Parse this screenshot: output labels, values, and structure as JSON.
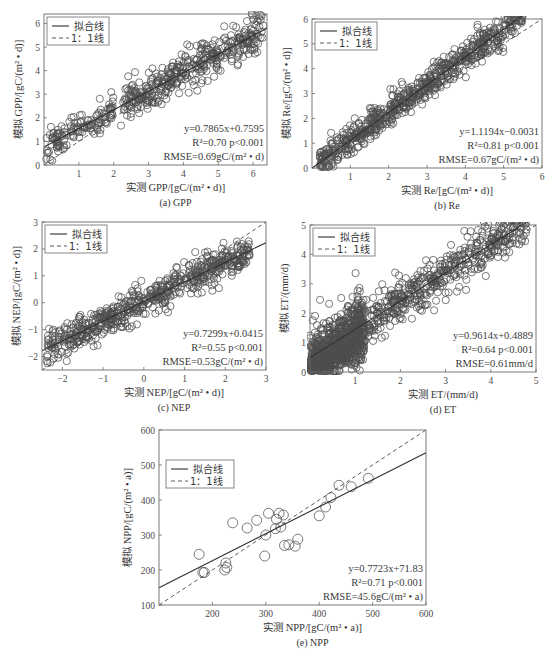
{
  "legend": {
    "fit_label": "拟合线",
    "one_to_one_label": "1：1线"
  },
  "chart_data": [
    {
      "id": "gpp",
      "type": "scatter",
      "caption": "(a) GPP",
      "xlabel": "实测 GPP/[gC/(m² • d)]",
      "ylabel": "模拟 GPP/[gC/(m² • d)]",
      "xlim": [
        0,
        6.4
      ],
      "ylim": [
        0,
        6.4
      ],
      "xticks": [
        1,
        2,
        3,
        4,
        5,
        6
      ],
      "yticks": [
        0,
        1,
        2,
        3,
        4,
        5,
        6
      ],
      "fit": {
        "slope": 0.7865,
        "intercept": 0.7595
      },
      "stats": {
        "equation": "y=0.7865x+0.7595",
        "r2": "R²=0.70  p<0.001",
        "rmse": "RMSE=0.69gC/(m² • d)"
      },
      "point_count": 520,
      "clusters": [
        {
          "n": 130,
          "xmin": 0.05,
          "xmax": 2.0,
          "noise": 0.55
        },
        {
          "n": 390,
          "xmin": 2.2,
          "xmax": 6.3,
          "noise": 0.75
        }
      ],
      "legend_position": "upper-left",
      "frame": {
        "left": 44,
        "top": 14,
        "width": 223,
        "height": 151
      }
    },
    {
      "id": "re",
      "type": "scatter",
      "caption": "(b) Re",
      "xlabel": "实测 Re/[gC/(m² • d)]",
      "ylabel": "模拟 Re/[gC/(m² • d)]",
      "xlim": [
        0,
        6
      ],
      "ylim": [
        0,
        6
      ],
      "xticks": [
        1,
        2,
        3,
        4,
        5,
        6
      ],
      "yticks": [
        0,
        1,
        2,
        3,
        4,
        5,
        6
      ],
      "fit": {
        "slope": 1.1194,
        "intercept": -0.0031
      },
      "stats": {
        "equation": "y=1.1194x−0.0031",
        "r2": "R²=0.81  p<0.001",
        "rmse": "RMSE=0.67gC/(m² • d)"
      },
      "point_count": 700,
      "clusters": [
        {
          "n": 700,
          "xmin": 0.2,
          "xmax": 5.5,
          "noise": 0.55
        }
      ],
      "legend_position": "upper-left",
      "frame": {
        "left": 312,
        "top": 19,
        "width": 230,
        "height": 149
      }
    },
    {
      "id": "nep",
      "type": "scatter",
      "caption": "(c) NEP",
      "xlabel": "实测 NEP/[gC/(m² • d)]",
      "ylabel": "模拟 NEP/[gC/(m² • d)]",
      "xlim": [
        -2.5,
        3
      ],
      "ylim": [
        -2.5,
        3
      ],
      "xticks": [
        -2,
        -1,
        0,
        1,
        2,
        3
      ],
      "yticks": [
        -2,
        -1,
        0,
        1,
        2,
        3
      ],
      "fit": {
        "slope": 0.7299,
        "intercept": 0.0415
      },
      "stats": {
        "equation": "y=0.7299x+0.0415",
        "r2": "R²=0.55  p<0.001",
        "rmse": "RMSE=0.53gC/(m² • d)"
      },
      "point_count": 600,
      "clusters": [
        {
          "n": 600,
          "xmin": -2.4,
          "xmax": 2.6,
          "noise": 0.55
        }
      ],
      "legend_position": "upper-left",
      "frame": {
        "left": 42,
        "top": 222,
        "width": 224,
        "height": 148
      }
    },
    {
      "id": "et",
      "type": "scatter",
      "caption": "(d) ET",
      "xlabel": "实测 ET/(mm/d)",
      "ylabel": "模拟 ET/(mm/d)",
      "xlim": [
        0,
        5
      ],
      "ylim": [
        0,
        5
      ],
      "xticks": [
        1,
        2,
        3,
        4,
        5
      ],
      "yticks": [
        0,
        1,
        2,
        3,
        4,
        5
      ],
      "fit": {
        "slope": 0.9614,
        "intercept": 0.4889
      },
      "stats": {
        "equation": "y=0.9614x+0.4889",
        "r2": "R²=0.64  p<0.001",
        "rmse": "RMSE=0.61mm/d"
      },
      "point_count": 1400,
      "clusters": [
        {
          "n": 900,
          "xmin": 0.0,
          "xmax": 1.2,
          "noise": 0.7
        },
        {
          "n": 500,
          "xmin": 1.0,
          "xmax": 4.8,
          "noise": 0.7
        }
      ],
      "legend_position": "upper-left",
      "frame": {
        "left": 310,
        "top": 225,
        "width": 226,
        "height": 147
      }
    },
    {
      "id": "npp",
      "type": "scatter",
      "caption": "(e) NPP",
      "xlabel": "实测 NPP/[gC/(m² • a)]",
      "ylabel": "模拟 NPP/[gC/(m² • a)]",
      "xlim": [
        100,
        600
      ],
      "ylim": [
        100,
        600
      ],
      "xticks": [
        200,
        300,
        400,
        500,
        600
      ],
      "yticks": [
        100,
        200,
        300,
        400,
        500,
        600
      ],
      "fit": {
        "slope": 0.7723,
        "intercept": 71.83
      },
      "stats": {
        "equation": "y=0.7723x+71.83",
        "r2": "R²=0.71  p<0.001",
        "rmse": "RMSE=45.6gC/(m² • a)"
      },
      "points": [
        [
          175,
          245
        ],
        [
          182,
          193
        ],
        [
          185,
          193
        ],
        [
          223,
          200
        ],
        [
          225,
          220
        ],
        [
          227,
          207
        ],
        [
          238,
          335
        ],
        [
          265,
          320
        ],
        [
          283,
          342
        ],
        [
          298,
          240
        ],
        [
          300,
          300
        ],
        [
          305,
          362
        ],
        [
          318,
          318
        ],
        [
          320,
          345
        ],
        [
          325,
          362
        ],
        [
          328,
          323
        ],
        [
          333,
          357
        ],
        [
          335,
          270
        ],
        [
          343,
          272
        ],
        [
          355,
          268
        ],
        [
          360,
          288
        ],
        [
          400,
          355
        ],
        [
          412,
          380
        ],
        [
          422,
          407
        ],
        [
          437,
          442
        ],
        [
          460,
          438
        ],
        [
          492,
          462
        ]
      ],
      "legend_position": "upper-left-inset",
      "frame": {
        "left": 159,
        "top": 430,
        "width": 267,
        "height": 175
      }
    }
  ]
}
